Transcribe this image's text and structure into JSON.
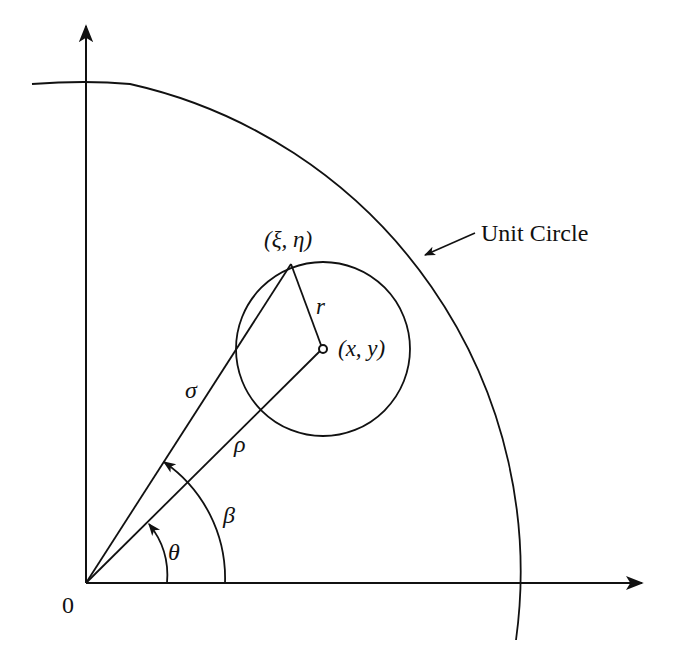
{
  "diagram": {
    "type": "geometry",
    "stroke_color": "#111111",
    "background_color": "#ffffff",
    "labels": {
      "origin": "0",
      "unit_circle": "Unit Circle",
      "boundary_point": "(ξ, η)",
      "center_point": "(x, y)",
      "radius": "r",
      "sigma": "σ",
      "rho": "ρ",
      "beta": "β",
      "theta": "θ"
    },
    "elements": [
      {
        "id": "x-axis",
        "kind": "arrow"
      },
      {
        "id": "y-axis",
        "kind": "arrow"
      },
      {
        "id": "unit-circle-arc",
        "kind": "arc"
      },
      {
        "id": "small-circle",
        "kind": "circle",
        "center_label": "(x, y)",
        "radius_label": "r"
      },
      {
        "id": "sigma-line",
        "kind": "segment",
        "from": "0",
        "to": "(ξ, η)"
      },
      {
        "id": "rho-line",
        "kind": "segment",
        "from": "0",
        "to": "(x, y)"
      },
      {
        "id": "theta-arc",
        "kind": "angle-arc"
      },
      {
        "id": "beta-arc",
        "kind": "angle-arc"
      }
    ]
  }
}
